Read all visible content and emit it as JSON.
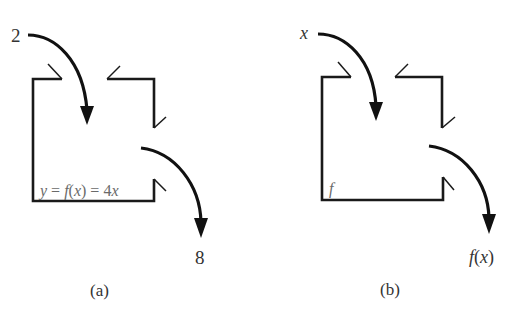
{
  "diagram": {
    "panel_a": {
      "caption": "(a)",
      "input_label": "2",
      "output_label": "8",
      "machine_label": "y = f(x) = 4x",
      "machine_label_parts": {
        "y": "y",
        "eq1": " = ",
        "f": "f",
        "lparen": "(",
        "x": "x",
        "rparen": ")",
        "eq2": " = 4",
        "x2": "x"
      }
    },
    "panel_b": {
      "caption": "(b)",
      "input_label": "x",
      "output_label": "f(x)",
      "output_parts": {
        "f": "f",
        "lparen": "(",
        "x": "x",
        "rparen": ")"
      },
      "machine_label": "f"
    },
    "colors": {
      "line": "#1a1a1a",
      "arrow": "#111111",
      "text": "#333333",
      "formula_text": "#6a6a6a"
    }
  }
}
